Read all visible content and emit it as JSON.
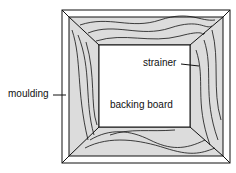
{
  "diagram": {
    "labels": {
      "moulding": "moulding",
      "strainer": "strainer",
      "backing_board": "backing board"
    },
    "colors": {
      "line": "#111111",
      "wood": "#dcdcdc",
      "background": "#ffffff"
    }
  }
}
